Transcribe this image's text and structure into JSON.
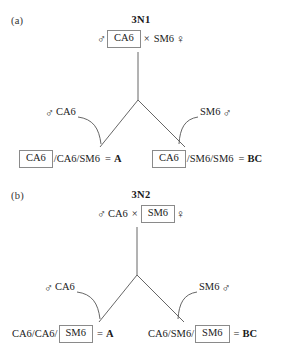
{
  "figure": {
    "symbols": {
      "male": "♂",
      "female": "♀",
      "cross": "×",
      "equals": "=",
      "slash": "/"
    },
    "panels": [
      {
        "id": "a",
        "label": "(a)",
        "title": "3N1",
        "cross": {
          "male_symbol": "♂",
          "male_genotype": "CA6",
          "male_boxed": true,
          "operator": "×",
          "female_genotype": "SM6",
          "female_boxed": false,
          "female_symbol": "♀"
        },
        "gamete_labels": {
          "left": {
            "symbol": "♂",
            "text": "CA6",
            "symbol_first": true
          },
          "right": {
            "symbol": "♂",
            "text": "SM6",
            "symbol_first": false
          }
        },
        "offspring": [
          {
            "boxed_allele": "CA6",
            "boxed_first": true,
            "rest": "/CA6/SM6",
            "equals": "=",
            "class": "A"
          },
          {
            "boxed_allele": "CA6",
            "boxed_first": true,
            "rest": "/SM6/SM6",
            "equals": "=",
            "class": "BC"
          }
        ]
      },
      {
        "id": "b",
        "label": "(b)",
        "title": "3N2",
        "cross": {
          "male_symbol": "♂",
          "male_genotype": "CA6",
          "male_boxed": false,
          "operator": "×",
          "female_genotype": "SM6",
          "female_boxed": true,
          "female_symbol": "♀"
        },
        "gamete_labels": {
          "left": {
            "symbol": "♂",
            "text": "CA6",
            "symbol_first": true
          },
          "right": {
            "symbol": "♂",
            "text": "SM6",
            "symbol_first": false
          }
        },
        "offspring": [
          {
            "boxed_allele": "SM6",
            "boxed_first": false,
            "rest": "CA6/CA6/",
            "equals": "=",
            "class": "A"
          },
          {
            "boxed_allele": "SM6",
            "boxed_first": false,
            "rest": "CA6/SM6/",
            "equals": "=",
            "class": "BC"
          }
        ]
      }
    ],
    "colors": {
      "text": "#1a1a1a",
      "box_border": "#8a8a8a",
      "connector_line": "#555555",
      "background": "#ffffff"
    }
  }
}
